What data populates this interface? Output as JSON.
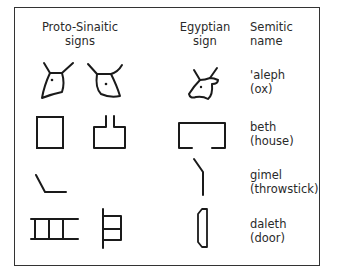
{
  "headers": {
    "proto_sinaitic": [
      "Proto-Sinaitic",
      "signs"
    ],
    "egyptian": [
      "Egyptian",
      "sign"
    ],
    "semitic": [
      "Semitic",
      "name"
    ]
  },
  "rows": [
    {
      "name": "'aleph",
      "meaning": "(ox)"
    },
    {
      "name": "beth",
      "meaning": "(house)"
    },
    {
      "name": "gimel",
      "meaning": "(throwstick)"
    },
    {
      "name": "daleth",
      "meaning": "(door)"
    }
  ]
}
